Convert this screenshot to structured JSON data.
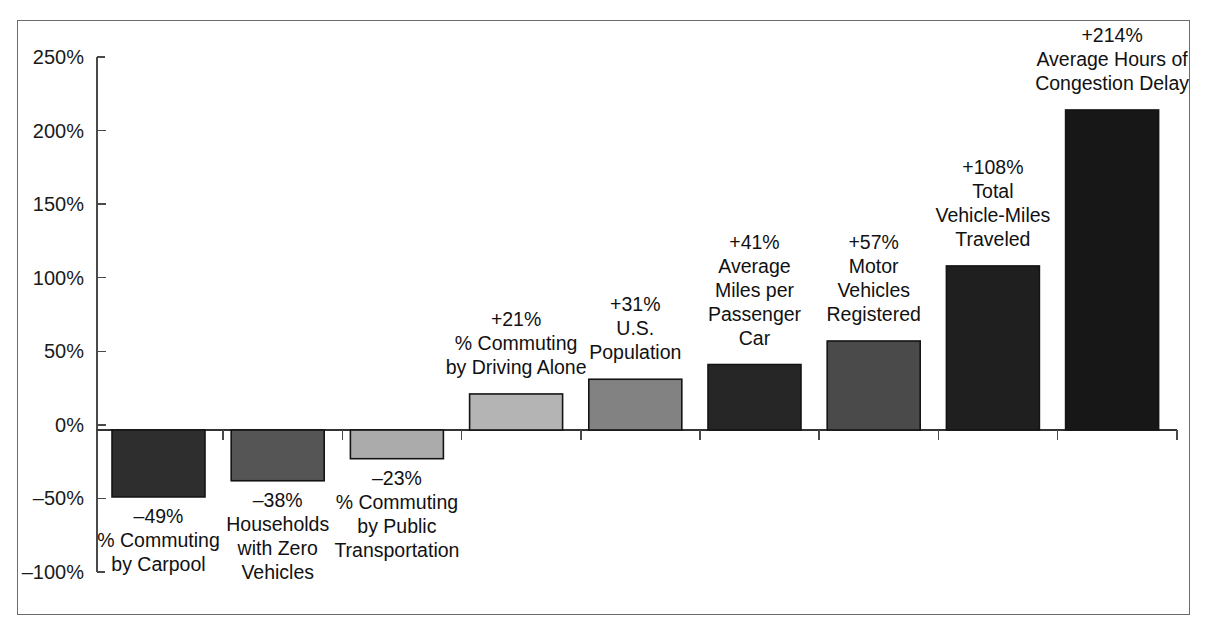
{
  "figure": {
    "frame_border_color": "#6b6b6b",
    "background_color": "#ffffff"
  },
  "chart_data": {
    "type": "bar",
    "title": "",
    "subtitle": "",
    "xlabel": "",
    "ylabel": "",
    "ylim": [
      -100,
      250
    ],
    "grid": false,
    "legend": "none",
    "y_tick_labels": [
      "250%",
      "200%",
      "150%",
      "100%",
      "50%",
      "0%",
      "-50%",
      "-100%"
    ],
    "y_ticks": [
      250,
      200,
      150,
      100,
      50,
      0,
      -50,
      -100
    ],
    "categories": [
      "% Commuting by Carpool",
      "Households with Zero Vehicles",
      "% Commuting by Public Transportation",
      "% Commuting by Driving Alone",
      "U.S. Population",
      "Average Miles per Passenger Car",
      "Motor Vehicles Registered",
      "Total Vehicle-Miles Traveled",
      "Average Hours of Congestion Delay"
    ],
    "values": [
      -49,
      -38,
      -23,
      21,
      31,
      41,
      57,
      108,
      214
    ],
    "value_labels": [
      "-49%",
      "-38%",
      "-23%",
      "+21%",
      "+31%",
      "+41%",
      "+57%",
      "+108%",
      "+214%"
    ],
    "bars": [
      {
        "value": -49,
        "value_label": "-49%",
        "label_lines": [
          "% Commuting",
          "by Carpool"
        ],
        "color": "#2e2e2e",
        "label_position": "below"
      },
      {
        "value": -38,
        "value_label": "-38%",
        "label_lines": [
          "Households",
          "with Zero",
          "Vehicles"
        ],
        "color": "#555555",
        "label_position": "below"
      },
      {
        "value": -23,
        "value_label": "-23%",
        "label_lines": [
          "% Commuting",
          "by Public",
          "Transportation"
        ],
        "color": "#ababab",
        "label_position": "below"
      },
      {
        "value": 21,
        "value_label": "+21%",
        "label_lines": [
          "% Commuting",
          "by Driving Alone"
        ],
        "color": "#b4b4b4",
        "label_position": "above"
      },
      {
        "value": 31,
        "value_label": "+31%",
        "label_lines": [
          "U.S.",
          "Population"
        ],
        "color": "#828282",
        "label_position": "above"
      },
      {
        "value": 41,
        "value_label": "+41%",
        "label_lines": [
          "Average",
          "Miles per",
          "Passenger",
          "Car"
        ],
        "color": "#262626",
        "label_position": "above"
      },
      {
        "value": 57,
        "value_label": "+57%",
        "label_lines": [
          "Motor",
          "Vehicles",
          "Registered"
        ],
        "color": "#4a4a4a",
        "label_position": "above"
      },
      {
        "value": 108,
        "value_label": "+108%",
        "label_lines": [
          "Total",
          "Vehicle-Miles",
          "Traveled"
        ],
        "color": "#1f1f1f",
        "label_position": "above"
      },
      {
        "value": 214,
        "value_label": "+214%",
        "label_lines": [
          "Average Hours of",
          "Congestion Delay"
        ],
        "color": "#171717",
        "label_position": "above"
      }
    ]
  },
  "geometry": {
    "axis_x": 97,
    "y_top_value": 250,
    "y_top_px": 57,
    "y_bottom_value": -100,
    "y_bottom_px": 572,
    "zero_px": 430,
    "plot_left": 104,
    "bar_pitch": 119.2,
    "bar_width": 93,
    "bar_first_left": 112,
    "line_height": 24,
    "label_font_size": 19.5
  }
}
